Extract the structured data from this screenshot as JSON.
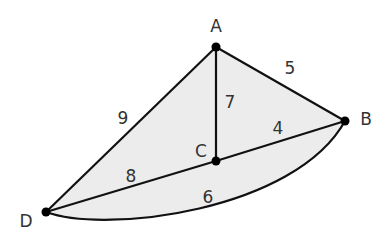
{
  "diagram": {
    "type": "weighted-graph",
    "fill_color": "#ececec",
    "edge_color": "#111111",
    "nodes": [
      {
        "id": "A",
        "label": "A",
        "x": 216,
        "y": 47,
        "lx": 216,
        "ly": 32
      },
      {
        "id": "B",
        "label": "B",
        "x": 345,
        "y": 121,
        "lx": 366,
        "ly": 125
      },
      {
        "id": "C",
        "label": "C",
        "x": 216,
        "y": 161,
        "lx": 201,
        "ly": 157
      },
      {
        "id": "D",
        "label": "D",
        "x": 46,
        "y": 212,
        "lx": 26,
        "ly": 227
      }
    ],
    "edges": [
      {
        "from": "A",
        "to": "D",
        "weight": "9",
        "lx": 123,
        "ly": 124
      },
      {
        "from": "A",
        "to": "B",
        "weight": "5",
        "lx": 290,
        "ly": 74
      },
      {
        "from": "A",
        "to": "C",
        "weight": "7",
        "lx": 230,
        "ly": 108
      },
      {
        "from": "C",
        "to": "B",
        "weight": "4",
        "lx": 278,
        "ly": 134
      },
      {
        "from": "D",
        "to": "C",
        "weight": "8",
        "lx": 131,
        "ly": 182
      },
      {
        "from": "D",
        "to": "B",
        "weight": "6",
        "lx": 208,
        "ly": 203,
        "curved": true
      }
    ]
  }
}
